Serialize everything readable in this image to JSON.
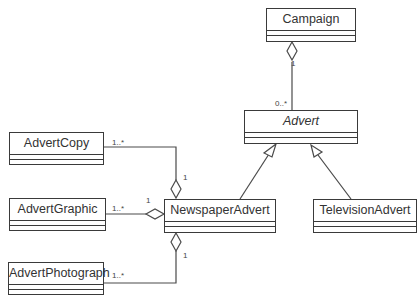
{
  "diagram": {
    "type": "UML class diagram",
    "classes": [
      {
        "id": "campaign",
        "name": "Campaign",
        "abstract": false,
        "x": 266,
        "y": 8,
        "w": 90,
        "h": 34
      },
      {
        "id": "advert",
        "name": "Advert",
        "abstract": true,
        "x": 244,
        "y": 110,
        "w": 114,
        "h": 34
      },
      {
        "id": "newspaper",
        "name": "NewspaperAdvert",
        "abstract": false,
        "x": 164,
        "y": 199,
        "w": 112,
        "h": 34
      },
      {
        "id": "television",
        "name": "TelevisionAdvert",
        "abstract": false,
        "x": 313,
        "y": 199,
        "w": 104,
        "h": 34
      },
      {
        "id": "copy",
        "name": "AdvertCopy",
        "abstract": false,
        "x": 9,
        "y": 132,
        "w": 95,
        "h": 33
      },
      {
        "id": "graphic",
        "name": "AdvertGraphic",
        "abstract": false,
        "x": 9,
        "y": 198,
        "w": 97,
        "h": 33
      },
      {
        "id": "photo",
        "name": "AdvertPhotograph",
        "abstract": false,
        "x": 8,
        "y": 262,
        "w": 96,
        "h": 33
      }
    ],
    "relationships": [
      {
        "type": "aggregation",
        "whole": "Campaign",
        "part": "Advert",
        "whole_multiplicity": "1",
        "part_multiplicity": "0..*"
      },
      {
        "type": "generalization",
        "parent": "Advert",
        "child": "NewspaperAdvert"
      },
      {
        "type": "generalization",
        "parent": "Advert",
        "child": "TelevisionAdvert"
      },
      {
        "type": "aggregation",
        "whole": "NewspaperAdvert",
        "part": "AdvertCopy",
        "whole_multiplicity": "1",
        "part_multiplicity": "1..*"
      },
      {
        "type": "aggregation",
        "whole": "NewspaperAdvert",
        "part": "AdvertGraphic",
        "whole_multiplicity": "1",
        "part_multiplicity": "1..*"
      },
      {
        "type": "aggregation",
        "whole": "NewspaperAdvert",
        "part": "AdvertPhotograph",
        "whole_multiplicity": "1",
        "part_multiplicity": "1..*"
      }
    ],
    "labels": [
      {
        "id": "campaign-1",
        "text": "1",
        "x": 291,
        "y": 59
      },
      {
        "id": "advert-0n",
        "text": "0..*",
        "x": 275,
        "y": 99
      },
      {
        "id": "copy-1n",
        "text": "1..*",
        "x": 112,
        "y": 138
      },
      {
        "id": "copy-1",
        "text": "1",
        "x": 183,
        "y": 173
      },
      {
        "id": "graphic-1n",
        "text": "1..*",
        "x": 112,
        "y": 204
      },
      {
        "id": "graphic-1",
        "text": "1",
        "x": 146,
        "y": 196
      },
      {
        "id": "photo-1n",
        "text": "1..*",
        "x": 112,
        "y": 271
      },
      {
        "id": "photo-1",
        "text": "1",
        "x": 183,
        "y": 251
      }
    ],
    "line_color": "#4a4a4a"
  }
}
